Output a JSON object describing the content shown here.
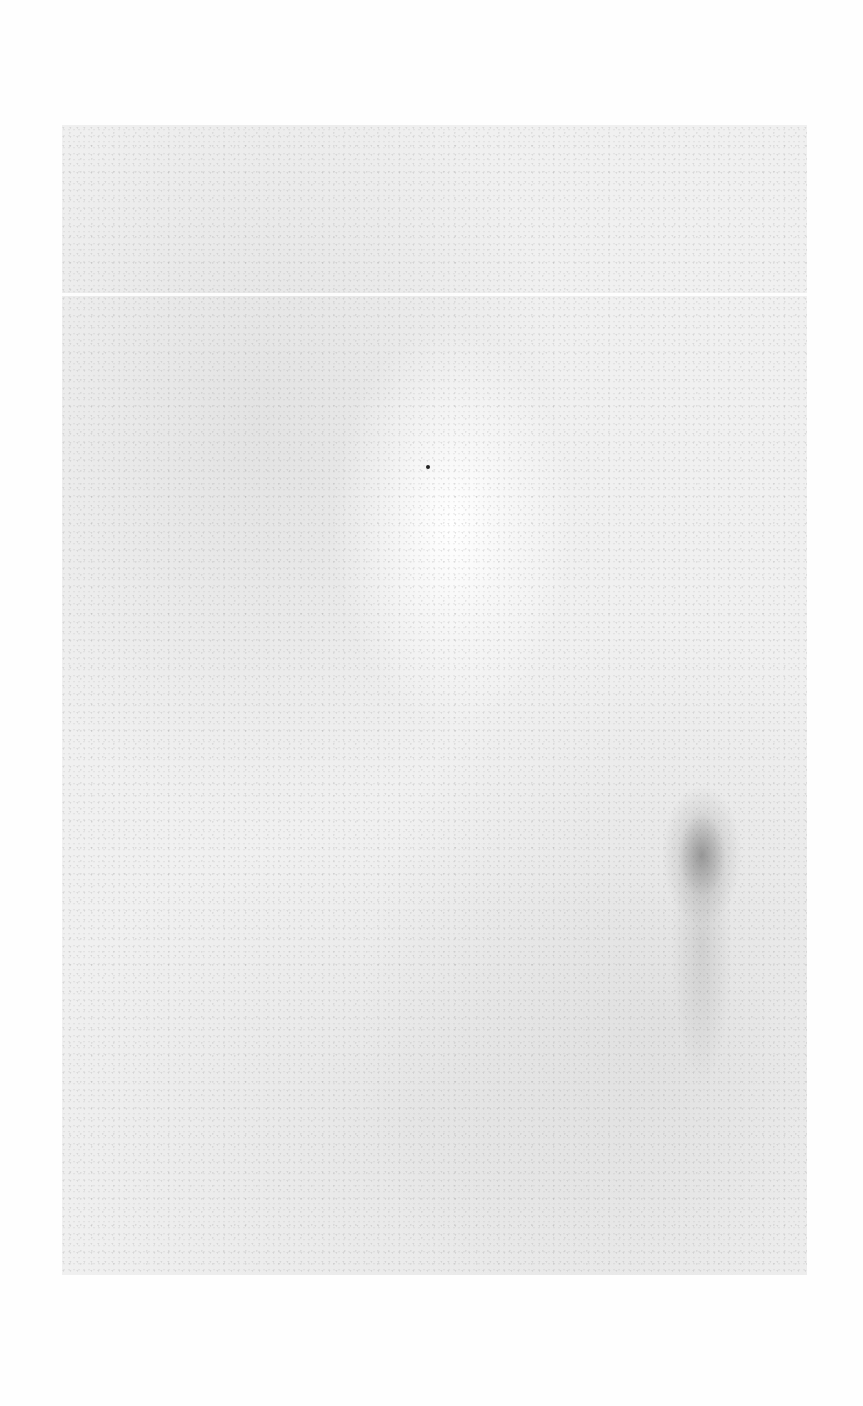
{
  "document": {
    "type": "scanned-blank-page",
    "page_marker": "",
    "text": ""
  }
}
